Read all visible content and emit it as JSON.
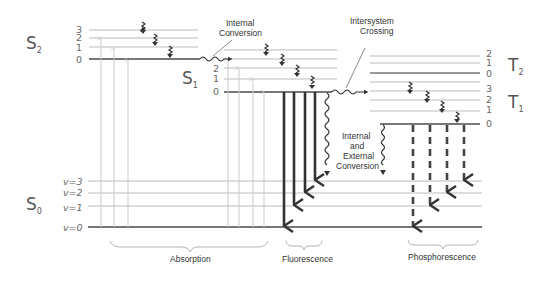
{
  "colors": {
    "background": "#ffffff",
    "level_line": "#aaaaaa",
    "ground_line": "#777777",
    "absorption_arrow": "#c9c9c9",
    "emission_arrow": "#333333",
    "text": "#333333"
  },
  "states": {
    "S2": {
      "label": "S",
      "sub": "2",
      "levels": [
        "3",
        "2",
        "1",
        "0"
      ]
    },
    "S1": {
      "label": "S",
      "sub": "1",
      "levels": [
        "2",
        "1",
        "0"
      ]
    },
    "T2": {
      "label": "T",
      "sub": "2",
      "levels": [
        "2",
        "1",
        "0"
      ]
    },
    "T1": {
      "label": "T",
      "sub": "1",
      "levels": [
        "3",
        "2",
        "1",
        "0"
      ]
    },
    "S0": {
      "label": "S",
      "sub": "0",
      "levels": [
        "v=3",
        "v=2",
        "v=1",
        "v=0"
      ]
    }
  },
  "annotations": {
    "internal_conversion": [
      "Internal",
      "Conversion"
    ],
    "intersystem_crossing": [
      "Intersystem",
      "Crossing"
    ],
    "internal_external_conversion": [
      "Internal",
      "and",
      "External",
      "Conversion"
    ]
  },
  "categories": {
    "absorption": "Absorption",
    "fluorescence": "Fluorescence",
    "phosphorescence": "Phosphorescence"
  }
}
